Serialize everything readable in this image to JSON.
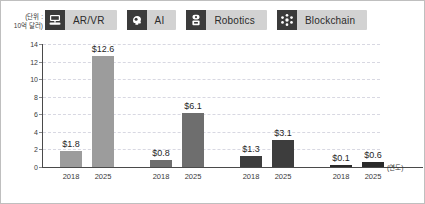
{
  "unit_caption": {
    "line1": "(단위 :",
    "line2": "10억 달러)"
  },
  "legend": {
    "items": [
      {
        "label": "AR/VR",
        "icon": "ar-vr-headset-icon",
        "color": "#9c9c9c"
      },
      {
        "label": "AI",
        "icon": "ai-brain-head-icon",
        "color": "#6e6e6e"
      },
      {
        "label": "Robotics",
        "icon": "robot-icon",
        "color": "#3d3d3d"
      },
      {
        "label": "Blockchain",
        "icon": "blockchain-nodes-icon",
        "color": "#2a2a2a"
      }
    ]
  },
  "axis": {
    "x_title": "(연도)",
    "y_ticks": [
      "14",
      "12",
      "10",
      "8",
      "6",
      "4",
      "2",
      "0"
    ]
  },
  "chart_data": {
    "type": "bar",
    "title": "",
    "xlabel": "(연도)",
    "ylabel": "(단위 : 10억 달러)",
    "ylim": [
      0,
      14
    ],
    "grid": true,
    "legend_position": "top",
    "categories": [
      "2018",
      "2025"
    ],
    "groups": [
      {
        "name": "AR/VR",
        "color": "#9c9c9c",
        "values": [
          1.8,
          12.6
        ],
        "labels": [
          "$1.8",
          "$12.6"
        ]
      },
      {
        "name": "AI",
        "color": "#6e6e6e",
        "values": [
          0.8,
          6.1
        ],
        "labels": [
          "$0.8",
          "$6.1"
        ]
      },
      {
        "name": "Robotics",
        "color": "#3d3d3d",
        "values": [
          1.3,
          3.1
        ],
        "labels": [
          "$1.3",
          "$3.1"
        ]
      },
      {
        "name": "Blockchain",
        "color": "#2a2a2a",
        "values": [
          0.1,
          0.6
        ],
        "labels": [
          "$0.1",
          "$0.6"
        ]
      }
    ]
  }
}
